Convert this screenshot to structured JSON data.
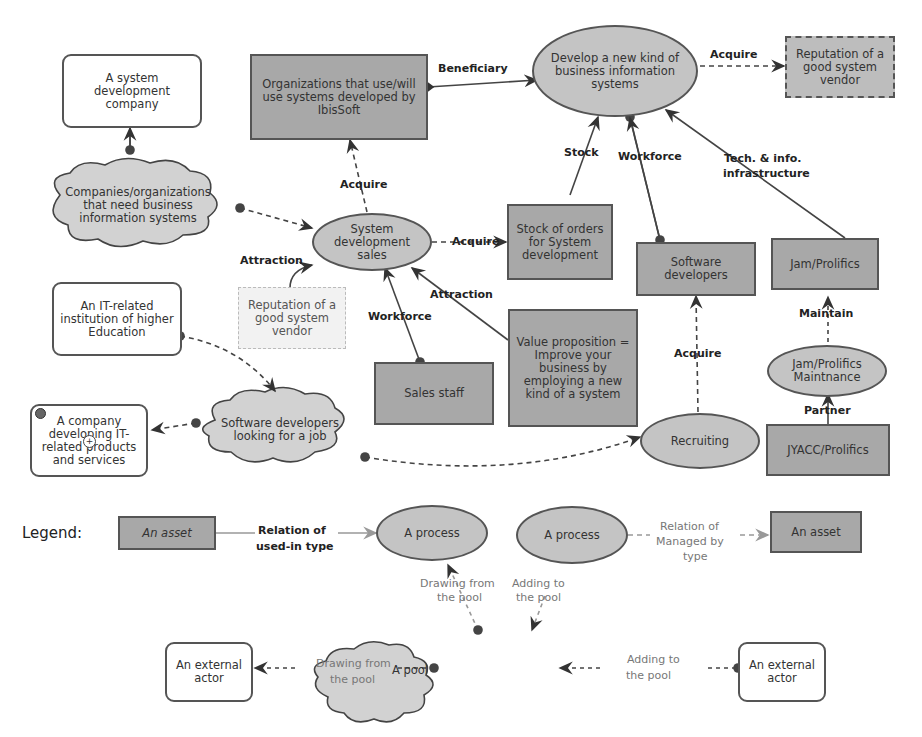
{
  "diagram": {
    "nodes": {
      "system_dev_company": "A system development company",
      "organizations_ibissoft": "Organizations that use/will use systems developed by IbisSoft",
      "develop_new_kind": "Develop a new kind of business information systems",
      "reputation_top": "Reputation of a good system vendor",
      "companies_need": "Companies/organizations that need business information systems",
      "sys_dev_sales": "System development sales",
      "stock_orders": "Stock of orders for System development",
      "software_developers": "Software developers",
      "jam_prolifics": "Jam/Prolifics",
      "reputation_ghost": "Reputation of a good system vendor",
      "it_institution": "An IT-related institution of higher Education",
      "value_proposition": "Value proposition = Improve your business by employing a new kind of a system",
      "sales_staff": "Sales staff",
      "jam_maint": "Jam/Prolifics Maintnance",
      "company_it": "A company developing IT-related products and services",
      "sw_dev_looking": "Software developers looking for a job",
      "recruiting": "Recruiting",
      "jyacc": "JYACC/Prolifics"
    },
    "edges": {
      "beneficiary": "Beneficiary",
      "acquire_rep": "Acquire",
      "stock": "Stock",
      "workforce_top": "Workforce",
      "tech_info": "Tech. & info.",
      "tech_info2": "infrastructure",
      "acquire_org": "Acquire",
      "acquire_stock": "Acquire",
      "attraction_left": "Attraction",
      "attraction_right": "Attraction",
      "workforce_sales": "Workforce",
      "maintain": "Maintain",
      "acquire_sw": "Acquire",
      "partner": "Partner"
    },
    "legend": {
      "title": "Legend:",
      "asset1": "An asset",
      "rel_used_in": "Relation of",
      "rel_used_in2": "used-in type",
      "process1": "A process",
      "process2": "A process",
      "rel_managed": "Relation of",
      "rel_managed2": "Managed by",
      "rel_managed3": "type",
      "asset2": "An asset",
      "drawing1": "Drawing from",
      "drawing1b": "the pool",
      "adding1": "Adding to",
      "adding1b": "the pool",
      "pool": "A pool",
      "actor_left": "An external actor",
      "actor_right": "An external actor",
      "drawing2": "Drawing from",
      "drawing2b": "the pool",
      "adding2": "Adding to",
      "adding2b": "the pool"
    }
  },
  "colors": {
    "asset_fill": "#a8a8a8",
    "process_fill": "#c4c4c4",
    "pool_fill": "#d2d2d2",
    "stroke": "#555555"
  }
}
